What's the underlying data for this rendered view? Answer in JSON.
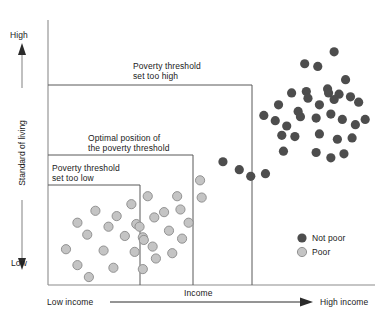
{
  "figure": {
    "title": "",
    "axes": {
      "y_title": "Standard of living",
      "y_high_label": "High",
      "y_low_label": "Low",
      "x_title": "Income",
      "x_low_label": "Low income",
      "x_high_label": "High income"
    },
    "annotations": [
      {
        "id": "too-high",
        "line1": "Poverty threshold",
        "line2": "set too high"
      },
      {
        "id": "optimal",
        "line1": "Optimal position of",
        "line2": "the poverty threshold"
      },
      {
        "id": "too-low",
        "line1": "Poverty threshold",
        "line2": "set too low"
      }
    ],
    "legend": {
      "items": [
        {
          "label": "Not poor",
          "color": "#4d4d4d"
        },
        {
          "label": "Poor",
          "color": "#c4c4c4"
        }
      ]
    },
    "colors": {
      "not_poor": "#4d4d4d",
      "poor": "#c4c4c4",
      "poor_stroke": "#8a8a8a",
      "axis": "#8c8c8c",
      "threshold_line": "#595959",
      "text": "#1a1a1a"
    }
  },
  "chart_data": {
    "type": "scatter",
    "title": "",
    "xlabel": "Income",
    "ylabel": "Standard of living",
    "xlim": [
      0,
      100
    ],
    "ylim": [
      0,
      100
    ],
    "grid": false,
    "legend_position": "bottom-right",
    "axis_tick_labels": {
      "x": [
        "Low income",
        "High income"
      ],
      "y": [
        "Low",
        "High"
      ]
    },
    "series": [
      {
        "name": "Not poor",
        "color": "#4d4d4d",
        "marker": "circle",
        "points": [
          [
            87.5,
            88.0
          ],
          [
            78.5,
            83.5
          ],
          [
            82.5,
            82.5
          ],
          [
            91.0,
            77.5
          ],
          [
            74.5,
            72.5
          ],
          [
            79.0,
            73.0
          ],
          [
            79.5,
            70.5
          ],
          [
            85.5,
            74.0
          ],
          [
            85.8,
            72.5
          ],
          [
            89.0,
            72.0
          ],
          [
            70.5,
            68.0
          ],
          [
            76.5,
            65.5
          ],
          [
            77.2,
            63.5
          ],
          [
            83.0,
            68.0
          ],
          [
            87.5,
            70.0
          ],
          [
            92.5,
            71.0
          ],
          [
            95.0,
            69.0
          ],
          [
            66.0,
            64.0
          ],
          [
            69.5,
            62.0
          ],
          [
            73.0,
            60.0
          ],
          [
            82.0,
            63.0
          ],
          [
            86.5,
            64.5
          ],
          [
            90.0,
            62.5
          ],
          [
            94.0,
            60.5
          ],
          [
            97.0,
            62.5
          ],
          [
            71.5,
            56.5
          ],
          [
            75.5,
            56.0
          ],
          [
            83.0,
            57.0
          ],
          [
            88.5,
            55.0
          ],
          [
            93.0,
            55.5
          ],
          [
            72.0,
            50.5
          ],
          [
            82.0,
            50.0
          ],
          [
            86.5,
            48.0
          ],
          [
            90.5,
            49.5
          ],
          [
            53.5,
            46.5
          ],
          [
            58.5,
            43.5
          ],
          [
            62.0,
            41.0
          ],
          [
            66.5,
            42.0
          ]
        ]
      },
      {
        "name": "Poor",
        "color": "#c4c4c4",
        "marker": "circle",
        "points": [
          [
            46.5,
            39.5
          ],
          [
            30.5,
            33.5
          ],
          [
            39.5,
            33.5
          ],
          [
            47.0,
            33.0
          ],
          [
            25.5,
            30.5
          ],
          [
            14.5,
            28.0
          ],
          [
            21.0,
            26.0
          ],
          [
            35.5,
            27.5
          ],
          [
            40.5,
            28.5
          ],
          [
            9.0,
            23.5
          ],
          [
            18.5,
            22.0
          ],
          [
            27.0,
            23.0
          ],
          [
            28.0,
            22.0
          ],
          [
            32.5,
            25.5
          ],
          [
            43.0,
            23.5
          ],
          [
            12.0,
            19.0
          ],
          [
            23.5,
            18.5
          ],
          [
            29.0,
            18.0
          ],
          [
            29.3,
            17.0
          ],
          [
            37.0,
            20.5
          ],
          [
            41.0,
            17.5
          ],
          [
            5.5,
            13.5
          ],
          [
            17.0,
            13.0
          ],
          [
            26.5,
            12.5
          ],
          [
            32.0,
            14.5
          ],
          [
            33.0,
            10.0
          ],
          [
            38.0,
            12.0
          ],
          [
            9.0,
            7.5
          ],
          [
            20.0,
            6.5
          ],
          [
            29.0,
            6.0
          ],
          [
            12.5,
            3.0
          ]
        ]
      }
    ],
    "threshold_boxes": [
      {
        "id": "too-low",
        "label": "Poverty threshold set too low",
        "x_max": 42.0,
        "y_max": 41.5
      },
      {
        "id": "optimal",
        "label": "Optimal position of the poverty threshold",
        "x_max": 63.0,
        "y_max": 53.5
      },
      {
        "id": "too-high",
        "label": "Poverty threshold set too high",
        "x_max": 86.5,
        "y_max": 79.0
      }
    ]
  }
}
